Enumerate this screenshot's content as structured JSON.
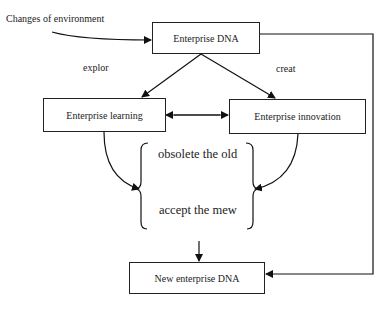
{
  "diagram": {
    "nodes": {
      "dna": {
        "label": "Enterprise DNA"
      },
      "learning": {
        "label": "Enterprise learning"
      },
      "innovation": {
        "label": "Enterprise innovation"
      },
      "new_dna": {
        "label": "New enterprise DNA"
      }
    },
    "labels": {
      "input": "Changes of environment",
      "explore": "explor",
      "create": "creat",
      "obsolete": "obsolete the old",
      "accept": "accept the mew"
    },
    "edges": [
      {
        "from": "Changes of environment",
        "to": "dna"
      },
      {
        "from": "dna",
        "to": "learning",
        "label": "explor"
      },
      {
        "from": "dna",
        "to": "innovation",
        "label": "creat"
      },
      {
        "from": "learning",
        "to": "innovation",
        "bidirectional": true
      },
      {
        "from": "learning",
        "to": "brace-group"
      },
      {
        "from": "innovation",
        "to": "brace-group"
      },
      {
        "from": "brace-group",
        "to": "new_dna"
      },
      {
        "from": "dna",
        "to": "new_dna",
        "route": "right-side"
      }
    ]
  }
}
